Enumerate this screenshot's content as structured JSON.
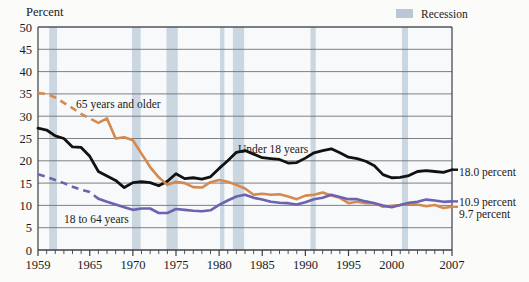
{
  "figure": {
    "axis_title_y": "Percent",
    "legend": {
      "swatch_name": "recession-swatch",
      "label": "Recession",
      "color": "#b9c7d6"
    }
  },
  "annotations": {
    "series_label_older": "65 years and older",
    "series_label_under18": "Under 18 years",
    "series_label_adults": "18 to 64 years",
    "end_label_under18": "18.0 percent",
    "end_label_adults": "10.9 percent",
    "end_label_older": "9.7 percent"
  },
  "chart_data": {
    "type": "line",
    "title": "",
    "subtitle": "",
    "xlabel": "",
    "ylabel": "Percent",
    "xlim": [
      1959,
      2007
    ],
    "ylim": [
      0,
      50
    ],
    "ytick_labels": [
      "0",
      "5",
      "10",
      "15",
      "20",
      "25",
      "30",
      "35",
      "40",
      "45",
      "50"
    ],
    "ytick_values": [
      0,
      5,
      10,
      15,
      20,
      25,
      30,
      35,
      40,
      45,
      50
    ],
    "xtick_labels": [
      "1959",
      "1965",
      "1970",
      "1975",
      "1980",
      "1985",
      "1990",
      "1995",
      "2000",
      "2007"
    ],
    "xtick_values": [
      1959,
      1965,
      1970,
      1975,
      1980,
      1985,
      1990,
      1995,
      2000,
      2007
    ],
    "minor_xticks_every": 1,
    "grid": "horizontal",
    "legend_position": "top-right",
    "x": [
      1959,
      1960,
      1961,
      1962,
      1963,
      1964,
      1965,
      1966,
      1967,
      1968,
      1969,
      1970,
      1971,
      1972,
      1973,
      1974,
      1975,
      1976,
      1977,
      1978,
      1979,
      1980,
      1981,
      1982,
      1983,
      1984,
      1985,
      1986,
      1987,
      1988,
      1989,
      1990,
      1991,
      1992,
      1993,
      1994,
      1995,
      1996,
      1997,
      1998,
      1999,
      2000,
      2001,
      2002,
      2003,
      2004,
      2005,
      2006,
      2007
    ],
    "series": [
      {
        "name": "Under 18 years",
        "color": "#111111",
        "style": "solid",
        "end_value": 18.0,
        "values": [
          27.3,
          26.9,
          25.6,
          25.0,
          23.1,
          23.0,
          21.0,
          17.6,
          16.6,
          15.6,
          14.0,
          15.1,
          15.3,
          15.1,
          14.4,
          15.4,
          17.1,
          16.0,
          16.2,
          15.9,
          16.4,
          18.3,
          20.0,
          21.9,
          22.3,
          21.5,
          20.7,
          20.5,
          20.3,
          19.5,
          19.6,
          20.6,
          21.8,
          22.3,
          22.7,
          21.8,
          20.8,
          20.5,
          19.9,
          18.9,
          16.9,
          16.2,
          16.3,
          16.7,
          17.6,
          17.8,
          17.6,
          17.4,
          18.0
        ]
      },
      {
        "name": "65 years and older",
        "color": "#d5894f",
        "style": "dashed-then-solid",
        "solid_from": 1966,
        "end_value": 9.7,
        "values": [
          35.2,
          35.0,
          34.2,
          33.0,
          31.8,
          30.5,
          29.5,
          28.5,
          29.5,
          25.0,
          25.3,
          24.6,
          21.6,
          18.6,
          16.3,
          14.6,
          15.3,
          15.0,
          14.1,
          14.0,
          15.2,
          15.7,
          15.3,
          14.6,
          13.8,
          12.4,
          12.6,
          12.4,
          12.5,
          12.0,
          11.4,
          12.2,
          12.4,
          12.9,
          12.2,
          11.7,
          10.5,
          10.8,
          10.5,
          10.5,
          9.7,
          9.9,
          10.1,
          10.4,
          10.2,
          9.8,
          10.1,
          9.4,
          9.7
        ]
      },
      {
        "name": "18 to 64 years",
        "color": "#6d62b0",
        "style": "dashed-then-solid",
        "solid_from": 1966,
        "end_value": 10.9,
        "values": [
          17.0,
          16.4,
          15.7,
          15.0,
          14.2,
          13.5,
          13.0,
          11.5,
          10.8,
          10.2,
          9.6,
          9.0,
          9.3,
          9.3,
          8.3,
          8.3,
          9.2,
          9.0,
          8.8,
          8.7,
          8.9,
          10.1,
          11.1,
          12.0,
          12.4,
          11.7,
          11.3,
          10.8,
          10.6,
          10.5,
          10.2,
          10.7,
          11.4,
          11.7,
          12.4,
          11.9,
          11.4,
          11.4,
          10.9,
          10.5,
          10.0,
          9.6,
          10.1,
          10.6,
          10.8,
          11.3,
          11.1,
          10.8,
          10.9
        ]
      }
    ],
    "recession_bands": [
      {
        "start": 1960.3,
        "end": 1961.2
      },
      {
        "start": 1969.9,
        "end": 1970.9
      },
      {
        "start": 1973.9,
        "end": 1975.2
      },
      {
        "start": 1980.1,
        "end": 1980.6
      },
      {
        "start": 1981.6,
        "end": 1982.9
      },
      {
        "start": 1990.6,
        "end": 1991.2
      },
      {
        "start": 2001.2,
        "end": 2001.9
      }
    ]
  }
}
